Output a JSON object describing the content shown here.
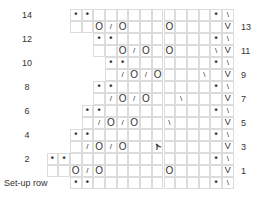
{
  "grid": {
    "left_x": 47,
    "top_y": 9,
    "cell_w": 11.7,
    "cell_h": 12,
    "columns": 16
  },
  "legend_symbols": {
    "dot": "•",
    "yo": "O",
    "k2tog": "/",
    "ssk": "\\",
    "slip": "V",
    "sk2p": "⋏"
  },
  "rows": [
    {
      "label": "14",
      "side": "left",
      "start": 2,
      "cells": {
        "2": "dot",
        "3": "dot",
        "14": "dot",
        "15": "ssk"
      }
    },
    {
      "label": "13",
      "side": "right",
      "start": 2,
      "cells": {
        "4": "yo",
        "5": "k2tog",
        "6": "yo",
        "10": "yo",
        "15": "slip"
      }
    },
    {
      "label": "12",
      "side": "left",
      "start": 4,
      "cells": {
        "4": "dot",
        "5": "dot",
        "14": "dot",
        "15": "ssk"
      }
    },
    {
      "label": "11",
      "side": "right",
      "start": 4,
      "cells": {
        "6": "yo",
        "7": "k2tog",
        "8": "yo",
        "10": "yo",
        "14": "ssk",
        "15": "slip"
      }
    },
    {
      "label": "10",
      "side": "left",
      "start": 5,
      "cells": {
        "5": "dot",
        "6": "dot",
        "14": "dot",
        "15": "ssk"
      }
    },
    {
      "label": "9",
      "side": "right",
      "start": 5,
      "cells": {
        "6": "k2tog",
        "7": "yo",
        "8": "k2tog",
        "9": "yo",
        "13": "ssk",
        "15": "slip"
      }
    },
    {
      "label": "8",
      "side": "left",
      "start": 4,
      "cells": {
        "4": "dot",
        "5": "dot",
        "14": "dot",
        "15": "ssk"
      }
    },
    {
      "label": "7",
      "side": "right",
      "start": 4,
      "cells": {
        "5": "k2tog",
        "6": "yo",
        "7": "k2tog",
        "8": "yo",
        "11": "ssk",
        "15": "slip"
      }
    },
    {
      "label": "6",
      "side": "left",
      "start": 3,
      "cells": {
        "3": "dot",
        "4": "dot",
        "14": "dot",
        "15": "ssk"
      }
    },
    {
      "label": "5",
      "side": "right",
      "start": 3,
      "cells": {
        "4": "k2tog",
        "5": "yo",
        "6": "k2tog",
        "7": "yo",
        "10": "ssk",
        "15": "slip"
      }
    },
    {
      "label": "4",
      "side": "left",
      "start": 2,
      "cells": {
        "2": "dot",
        "3": "dot",
        "14": "dot",
        "15": "ssk"
      }
    },
    {
      "label": "3",
      "side": "right",
      "start": 2,
      "cells": {
        "3": "k2tog",
        "4": "yo",
        "5": "k2tog",
        "6": "yo",
        "9": "sk2p",
        "15": "slip"
      }
    },
    {
      "label": "2",
      "side": "left",
      "start": 0,
      "cells": {
        "0": "dot",
        "1": "dot",
        "14": "dot",
        "15": "ssk"
      }
    },
    {
      "label": "1",
      "side": "right",
      "start": 0,
      "cells": {
        "2": "yo",
        "3": "k2tog",
        "4": "yo",
        "10": "yo",
        "15": "slip"
      }
    },
    {
      "label": "Set-up row",
      "side": "left",
      "start": 2,
      "cells": {
        "2": "dot",
        "3": "dot",
        "14": "dot",
        "15": "ssk"
      }
    }
  ]
}
